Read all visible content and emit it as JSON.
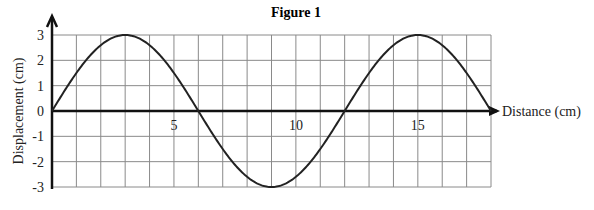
{
  "chart_data": {
    "type": "line",
    "title": "Figure 1",
    "xlabel": "Distance (cm)",
    "ylabel": "Displacement (cm)",
    "xlim": [
      0,
      18
    ],
    "ylim": [
      -3,
      3
    ],
    "x_ticks": [
      {
        "value": 5,
        "label": "5"
      },
      {
        "value": 10,
        "label": "10"
      },
      {
        "value": 15,
        "label": "15"
      }
    ],
    "y_ticks": [
      {
        "value": 3,
        "label": "3"
      },
      {
        "value": 2,
        "label": "2"
      },
      {
        "value": 1,
        "label": "1"
      },
      {
        "value": 0,
        "label": "0"
      },
      {
        "value": -1,
        "label": "-1"
      },
      {
        "value": -2,
        "label": "-2"
      },
      {
        "value": -3,
        "label": "-3"
      }
    ],
    "grid": true,
    "grid_step_x": 1,
    "grid_step_y": 1,
    "series": [
      {
        "name": "wave",
        "x": [
          0,
          3,
          6,
          9,
          12,
          15,
          18
        ],
        "values": [
          0,
          3,
          0,
          -3,
          0,
          3,
          0
        ],
        "amplitude": 3,
        "wavelength": 12,
        "shape": "sine"
      }
    ],
    "legend": null
  }
}
